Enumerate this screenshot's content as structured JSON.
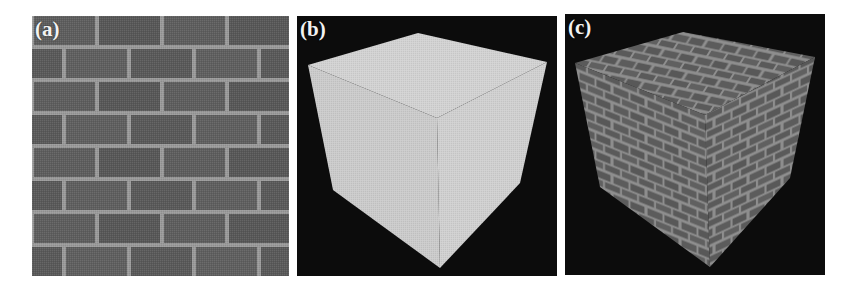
{
  "figure": {
    "panels": [
      {
        "id": "a",
        "label": "(a)",
        "content": "brick wall texture"
      },
      {
        "id": "b",
        "label": "(b)",
        "content": "untextured cube"
      },
      {
        "id": "c",
        "label": "(c)",
        "content": "brick-textured cube"
      }
    ]
  },
  "colors": {
    "brick": "#5c5c5c",
    "mortar": "#9c9c9c",
    "cube_plain": "#cdcdcd",
    "background_dark": "#0c0c0c"
  }
}
